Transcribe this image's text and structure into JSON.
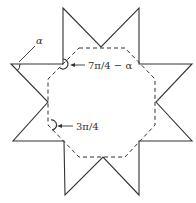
{
  "diagram": {
    "labels": {
      "alpha": "α",
      "reflex_angle": "7π/4 − α",
      "octagon_angle": "3π/4"
    },
    "colors": {
      "stroke": "#333333",
      "background": "#ffffff"
    }
  }
}
